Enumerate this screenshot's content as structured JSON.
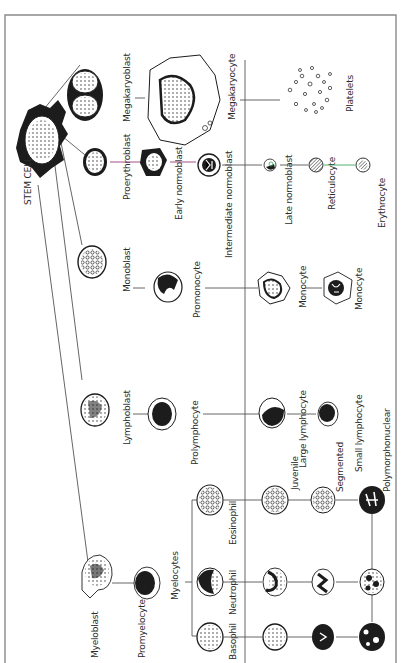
{
  "title": "STEM CELL",
  "colors": {
    "frame": "#8a8a8a",
    "line": "#555555",
    "erythroid_line": "#9b3a78",
    "reticulocyte_line": "#3fa860",
    "ink": "#1c1c1c"
  },
  "stem_cell": {
    "label": "STEM CELL"
  },
  "lineages": {
    "megakaryocytic": {
      "stages": [
        {
          "label": "Megakaryoblast"
        },
        {
          "label": "Megakaryocyte"
        },
        {
          "label": "Platelets"
        }
      ]
    },
    "erythroid": {
      "stages": [
        {
          "label": "Proerythroblast"
        },
        {
          "label": "Early normoblast"
        },
        {
          "label": "Intermediate normoblast"
        },
        {
          "label": "Late normoblast"
        },
        {
          "label": "Reticulocyte"
        },
        {
          "label": "Erythrocyte"
        }
      ]
    },
    "monocytic": {
      "stages": [
        {
          "label": "Monoblast"
        },
        {
          "label": "Promonocyte"
        },
        {
          "label": "Monocyte"
        },
        {
          "label": "Monocyte"
        }
      ]
    },
    "lymphocytic": {
      "stages": [
        {
          "label": "Lymphoblast"
        },
        {
          "label": "Prolymphocyte"
        },
        {
          "label": "Large lymphocyte"
        },
        {
          "label": "Small lymphocyte"
        }
      ]
    },
    "granulocytic": {
      "stages": [
        {
          "label": "Myeloblast"
        },
        {
          "label": "Promyelocyte"
        },
        {
          "label": "Myelocytes"
        }
      ],
      "branches": [
        {
          "label": "Eosinophil"
        },
        {
          "label": "Neutrophil"
        },
        {
          "label": "Basophil"
        }
      ],
      "later_stages": [
        {
          "label": "Juvenile"
        },
        {
          "label": "Segmented"
        },
        {
          "label": "Polymorphonuclear"
        }
      ]
    }
  }
}
